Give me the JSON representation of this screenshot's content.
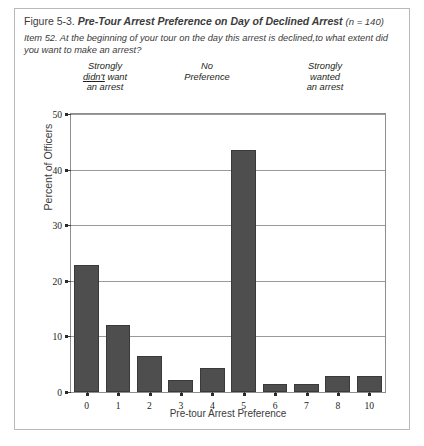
{
  "figure": {
    "number": "Figure 5-3.",
    "title": "Pre-Tour Arrest Preference on Day of Declined Arrest",
    "sample_note": "(n = 140)",
    "item_text": "Item 52. At the beginning of your tour on the day this arrest is declined,to what extent did you want to make an arrest?"
  },
  "anchors": {
    "low_line1": "Strongly",
    "low_line2_underlined": "didn't",
    "low_line2_rest": " want",
    "low_line3": "an arrest",
    "mid_line1": "No",
    "mid_line2": "Preference",
    "high_line1": "Strongly",
    "high_line2": "wanted",
    "high_line3": "an arrest"
  },
  "colors": {
    "bar_fill": "#4e4e4e",
    "bar_edge": "#3a3a3a",
    "grid": "#9a9a9a",
    "frame": "#8e8e8e",
    "page_border": "#b9b9b9",
    "text": "#231f20"
  },
  "chart_data": {
    "type": "bar",
    "title": "Pre-Tour Arrest Preference on Day of Declined Arrest",
    "subtitle": "Item 52. At the beginning of your tour on the day this arrest is declined,to what extent did you want to make an arrest?",
    "xlabel": "Pre-tour Arrest Preference",
    "ylabel": "Percent of Officers",
    "categories": [
      "0",
      "1",
      "2",
      "3",
      "4",
      "5",
      "6",
      "7",
      "8",
      "10"
    ],
    "values": [
      22.9,
      12.1,
      6.4,
      2.1,
      4.3,
      43.6,
      1.4,
      1.4,
      2.9,
      2.9
    ],
    "ylim": [
      0,
      50
    ],
    "yticks": [
      0,
      10,
      20,
      30,
      40,
      50
    ],
    "ytick_labels": [
      "0",
      "10",
      "20",
      "30",
      "40",
      "50"
    ],
    "grid": true,
    "legend": "none",
    "n": 140,
    "annotations": [
      "Strongly didn't want an arrest",
      "No Preference",
      "Strongly wanted an arrest"
    ]
  }
}
